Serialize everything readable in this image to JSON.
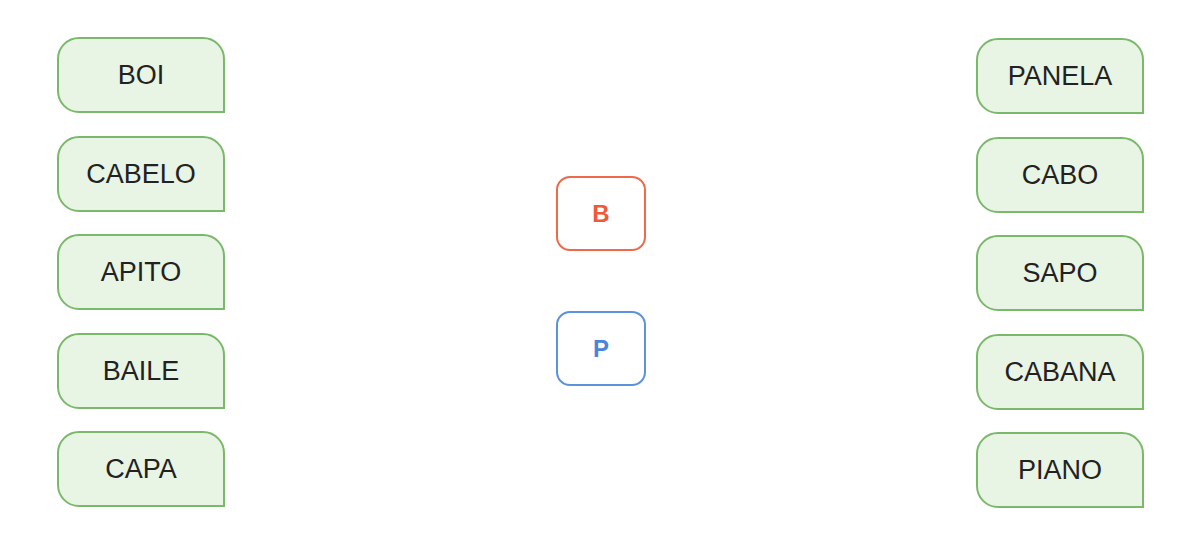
{
  "left_words": [
    "BOI",
    "CABELO",
    "APITO",
    "BAILE",
    "CAPA"
  ],
  "right_words": [
    "PANELA",
    "CABO",
    "SAPO",
    "CABANA",
    "PIANO"
  ],
  "letters": [
    {
      "label": "B",
      "color": "#ee5a3a"
    },
    {
      "label": "P",
      "color": "#4a86d8"
    }
  ],
  "colors": {
    "box_fill": "#e8f4e4",
    "box_border": "#7ab96a"
  }
}
